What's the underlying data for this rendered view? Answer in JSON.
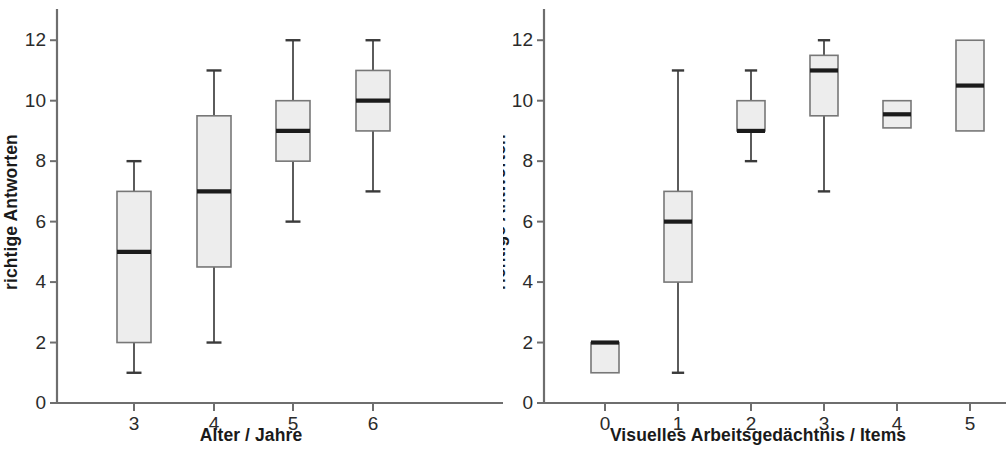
{
  "figure": {
    "background": "#ffffff",
    "box_fill": "#ededed",
    "box_stroke": "#777777",
    "median_color": "#1b1b1b",
    "whisker_color": "#4a4a4a",
    "axis_color": "#6e6e6e"
  },
  "chart_data": [
    {
      "type": "box",
      "panel": "left",
      "title": "",
      "xlabel": "Alter / Jahre",
      "ylabel": "richtige Antworten",
      "categories": [
        "3",
        "4",
        "5",
        "6"
      ],
      "xtick_labels": [
        "3",
        "4",
        "5",
        "6"
      ],
      "ytick_labels": [
        "0",
        "2",
        "4",
        "6",
        "8",
        "10",
        "12"
      ],
      "yticks": [
        0,
        2,
        4,
        6,
        8,
        10,
        12
      ],
      "ylim": [
        0,
        13
      ],
      "grid": false,
      "legend": "none",
      "boxes": [
        {
          "category": "3",
          "whisker_low": 1,
          "q1": 2,
          "median": 5,
          "q3": 7,
          "whisker_high": 8
        },
        {
          "category": "4",
          "whisker_low": 2,
          "q1": 4.5,
          "median": 7,
          "q3": 9.5,
          "whisker_high": 11
        },
        {
          "category": "5",
          "whisker_low": 6,
          "q1": 8,
          "median": 9,
          "q3": 10,
          "whisker_high": 12
        },
        {
          "category": "6",
          "whisker_low": 7,
          "q1": 9,
          "median": 10,
          "q3": 11,
          "whisker_high": 12
        }
      ]
    },
    {
      "type": "box",
      "panel": "right",
      "title": "",
      "xlabel": "Visuelles Arbeitsgedächtnis / Items",
      "ylabel": "richtige Antworten",
      "categories": [
        "0",
        "1",
        "2",
        "3",
        "4",
        "5"
      ],
      "xtick_labels": [
        "0",
        "1",
        "2",
        "3",
        "4",
        "5"
      ],
      "ytick_labels": [
        "0",
        "2",
        "4",
        "6",
        "8",
        "10",
        "12"
      ],
      "yticks": [
        0,
        2,
        4,
        6,
        8,
        10,
        12
      ],
      "ylim": [
        0,
        13
      ],
      "grid": false,
      "legend": "none",
      "boxes": [
        {
          "category": "0",
          "whisker_low": 1,
          "q1": 1,
          "median": 2,
          "q3": 2,
          "whisker_high": 2
        },
        {
          "category": "1",
          "whisker_low": 1,
          "q1": 4,
          "median": 6,
          "q3": 7,
          "whisker_high": 11
        },
        {
          "category": "2",
          "whisker_low": 8,
          "q1": 9,
          "median": 9,
          "q3": 10,
          "whisker_high": 11
        },
        {
          "category": "3",
          "whisker_low": 7,
          "q1": 9.5,
          "median": 11,
          "q3": 11.5,
          "whisker_high": 12
        },
        {
          "category": "4",
          "whisker_low": 9.1,
          "q1": 9.1,
          "median": 9.55,
          "q3": 10,
          "whisker_high": 10
        },
        {
          "category": "5",
          "whisker_low": 9,
          "q1": 9,
          "median": 10.5,
          "q3": 12,
          "whisker_high": 12
        }
      ]
    }
  ]
}
